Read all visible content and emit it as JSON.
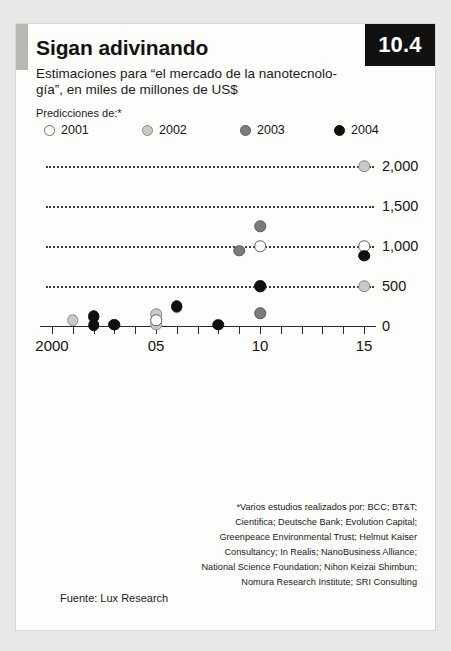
{
  "badge": {
    "text": "10.4"
  },
  "header": {
    "title": "Sigan adivinando",
    "subtitle": "Estimaciones para “el mercado de la nanotecnolo-gía”, en miles de millones de US$",
    "predictions_label": "Predicciones de:*"
  },
  "legend": {
    "items": [
      {
        "label": "2001",
        "color": "#ffffff",
        "border": "#6a6a6a"
      },
      {
        "label": "2002",
        "color": "#c9c9c9",
        "border": "#8a8a8a"
      },
      {
        "label": "2003",
        "color": "#7b7b7b",
        "border": "#5a5a5a"
      },
      {
        "label": "2004",
        "color": "#101010",
        "border": "#101010"
      }
    ]
  },
  "footnote": {
    "lines": [
      "*Varios estudios realizados por: BCC; BT&T;",
      "Cientifica; Deutsche Bank; Evolution Capital;",
      "Greenpeace Environmental Trust; Helmut Kaiser",
      "Consultancy; In Realis; NanoBusiness Alliance;",
      "National Science Foundation; Nihon Keizai Shimbun;",
      "Nomura Research Institute; SRI Consulting"
    ]
  },
  "source": {
    "text": "Fuente: Lux Research"
  },
  "chart_data": {
    "type": "scatter",
    "title": "Sigan adivinando",
    "subtitle": "Estimaciones para “el mercado de la nanotecnología”, en miles de millones de US$",
    "xlabel": "",
    "ylabel": "",
    "xlim": [
      1999.4,
      15.9
    ],
    "ylim": [
      0,
      2150
    ],
    "x_ticks": [
      2000,
      2001,
      2002,
      2003,
      2004,
      2005,
      2006,
      2007,
      2008,
      2009,
      2010,
      2011,
      2012,
      2013,
      2014,
      2015
    ],
    "x_tick_labels": [
      "2000",
      "",
      "",
      "",
      "",
      "05",
      "",
      "",
      "",
      "",
      "10",
      "",
      "",
      "",
      "",
      "15"
    ],
    "y_ticks": [
      0,
      500,
      1000,
      1500,
      2000
    ],
    "y_tick_labels": [
      "0",
      "500",
      "1,000",
      "1,500",
      "2,000"
    ],
    "grid": "horizontal-dotted",
    "legend_position": "top",
    "series": [
      {
        "name": "2001",
        "color": "#ffffff",
        "border": "#5f5f5f",
        "points": [
          {
            "x": 2005,
            "y": 75
          },
          {
            "x": 2010,
            "y": 1000
          },
          {
            "x": 2015,
            "y": 1000
          }
        ]
      },
      {
        "name": "2002",
        "color": "#c9c9c9",
        "border": "#8a8a8a",
        "points": [
          {
            "x": 2001,
            "y": 70
          },
          {
            "x": 2002,
            "y": 110
          },
          {
            "x": 2003,
            "y": 15
          },
          {
            "x": 2005,
            "y": 15
          },
          {
            "x": 2005,
            "y": 150
          },
          {
            "x": 2006,
            "y": 235
          },
          {
            "x": 2010,
            "y": 500
          },
          {
            "x": 2015,
            "y": 500
          },
          {
            "x": 2015,
            "y": 2000
          },
          {
            "x": 2015,
            "y": 880
          }
        ]
      },
      {
        "name": "2003",
        "color": "#7b7b7b",
        "border": "#5a5a5a",
        "points": [
          {
            "x": 2002,
            "y": 115
          },
          {
            "x": 2003,
            "y": 18
          },
          {
            "x": 2006,
            "y": 238
          },
          {
            "x": 2009,
            "y": 940
          },
          {
            "x": 2010,
            "y": 1250
          },
          {
            "x": 2010,
            "y": 160
          },
          {
            "x": 2010,
            "y": 505
          }
        ]
      },
      {
        "name": "2004",
        "color": "#101010",
        "border": "#101010",
        "points": [
          {
            "x": 2002,
            "y": 120
          },
          {
            "x": 2002,
            "y": 12
          },
          {
            "x": 2003,
            "y": 15
          },
          {
            "x": 2006,
            "y": 245
          },
          {
            "x": 2008,
            "y": 15
          },
          {
            "x": 2010,
            "y": 500
          },
          {
            "x": 2015,
            "y": 880
          }
        ]
      }
    ]
  }
}
